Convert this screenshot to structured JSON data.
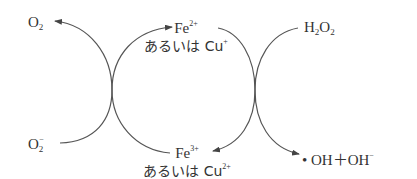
{
  "diagram": {
    "type": "redox-cycle",
    "nodes": {
      "o2": {
        "base": "O",
        "sub": "2",
        "sup": ""
      },
      "superoxide": {
        "base": "O",
        "sub": "2",
        "sup": "−"
      },
      "h2o2": {
        "a": "H",
        "sub1": "2",
        "b": "O",
        "sub2": "2"
      },
      "fe2": {
        "base": "Fe",
        "sup": "2+",
        "alt_prefix": "あるいは Cu",
        "alt_sup": "+"
      },
      "fe3": {
        "base": "Fe",
        "sup": "3+",
        "alt_prefix": "あるいは Cu",
        "alt_sup": "2+"
      },
      "products": {
        "text": "• OH＋OH",
        "sup": "−"
      }
    },
    "edges": [
      {
        "from": "superoxide",
        "to": "o2",
        "note": "O2− oxidized to O2"
      },
      {
        "from": "fe3",
        "to": "fe2",
        "note": "Fe3+ / Cu2+ reduced to Fe2+ / Cu+"
      },
      {
        "from": "fe2",
        "to": "fe3",
        "note": "Fe2+ / Cu+ oxidized to Fe3+ / Cu2+"
      },
      {
        "from": "h2o2",
        "to": "products",
        "note": "H2O2 reduced to •OH + OH−"
      }
    ],
    "colors": {
      "line": "#555555",
      "text": "#333333",
      "background": "#ffffff"
    }
  }
}
